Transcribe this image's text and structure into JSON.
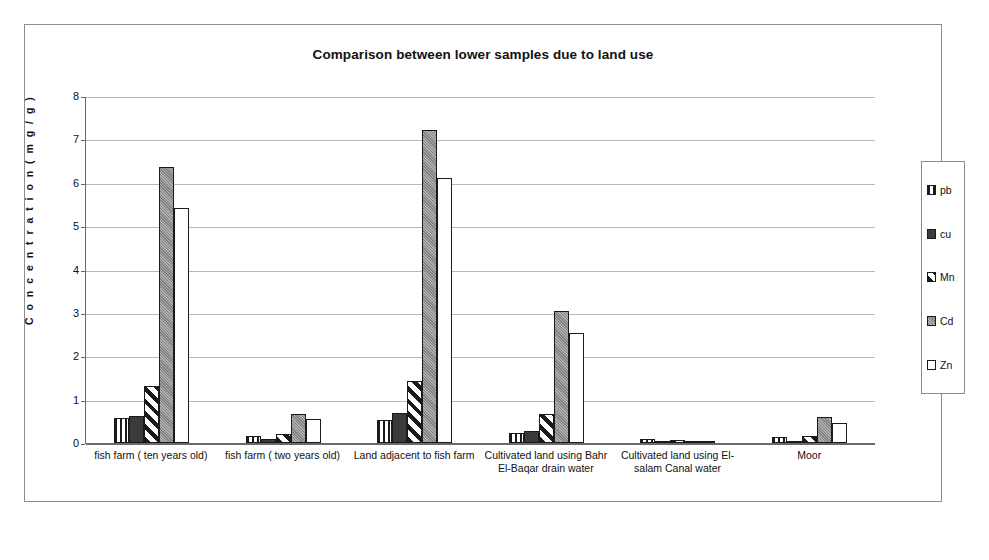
{
  "chart_data": {
    "type": "bar",
    "title": "Comparison between lower samples due to land use",
    "xlabel": "",
    "ylabel": "C o n c e n t r a t i o n (  m g / g )",
    "ylim": [
      0,
      8
    ],
    "yticks": [
      0,
      1,
      2,
      3,
      4,
      5,
      6,
      7,
      8
    ],
    "ytick_labels": [
      "0",
      "1",
      "2",
      "3",
      "4",
      "5",
      "6",
      "7",
      "8"
    ],
    "grid": true,
    "legend_position": "right",
    "categories": [
      "fish farm ( ten years old)",
      "fish farm ( two years old)",
      "Land adjacent to fish farm",
      "Cultivated land using Bahr El-Baqar drain water",
      "Cultivated land using El-salam Canal water",
      "Moor"
    ],
    "series": [
      {
        "name": "pb",
        "pattern": "vertical-stripes",
        "color": "#ffffff",
        "values": [
          0.57,
          0.17,
          0.54,
          0.24,
          0.09,
          0.13
        ]
      },
      {
        "name": "cu",
        "pattern": "solid-dark",
        "color": "#3b3b3b",
        "values": [
          0.63,
          0.1,
          0.7,
          0.28,
          0.04,
          0.05
        ]
      },
      {
        "name": "Mn",
        "pattern": "diagonal-stripes",
        "color": "#ffffff",
        "values": [
          1.31,
          0.2,
          1.43,
          0.67,
          0.07,
          0.17
        ]
      },
      {
        "name": "Cd",
        "pattern": "gray-stipple",
        "color": "#8e8e8e",
        "values": [
          6.37,
          0.68,
          7.22,
          3.05,
          0.05,
          0.6
        ]
      },
      {
        "name": "Zn",
        "pattern": "white",
        "color": "#ffffff",
        "values": [
          5.41,
          0.55,
          6.12,
          2.53,
          0.02,
          0.47
        ]
      }
    ]
  }
}
